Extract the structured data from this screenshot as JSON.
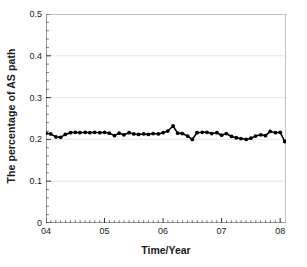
{
  "chart_data": {
    "type": "line",
    "title": "",
    "subtitle": "",
    "xlabel": "Time/Year",
    "ylabel": "The percentage of AS path",
    "xlim": [
      2004.0,
      2008.1
    ],
    "ylim": [
      0,
      0.5
    ],
    "grid": true,
    "grid_axis": "y",
    "legend": false,
    "legend_position": "none",
    "marker": "filled-circle",
    "line_color": "#000000",
    "marker_color": "#000000",
    "xtick_labels": [
      "04",
      "05",
      "06",
      "07",
      "08"
    ],
    "xtick_values": [
      2004,
      2005,
      2006,
      2007,
      2008
    ],
    "ytick_labels": [
      "0",
      "0.1",
      "0.2",
      "0.3",
      "0.4",
      "0.5"
    ],
    "ytick_values": [
      0,
      0.1,
      0.2,
      0.3,
      0.4,
      0.5
    ],
    "x_minor_ticks_per_interval": 12,
    "y_minor_ticks_per_interval": 5,
    "series": [
      {
        "name": "The percentage of AS path",
        "x": [
          2004.0,
          2004.08,
          2004.17,
          2004.25,
          2004.33,
          2004.42,
          2004.5,
          2004.58,
          2004.67,
          2004.75,
          2004.83,
          2004.92,
          2005.0,
          2005.08,
          2005.17,
          2005.25,
          2005.33,
          2005.42,
          2005.5,
          2005.58,
          2005.67,
          2005.75,
          2005.83,
          2005.92,
          2006.0,
          2006.08,
          2006.17,
          2006.25,
          2006.33,
          2006.42,
          2006.5,
          2006.58,
          2006.67,
          2006.75,
          2006.83,
          2006.92,
          2007.0,
          2007.08,
          2007.17,
          2007.25,
          2007.33,
          2007.42,
          2007.5,
          2007.58,
          2007.67,
          2007.75,
          2007.83,
          2007.92,
          2008.0,
          2008.08
        ],
        "values": [
          0.215,
          0.213,
          0.206,
          0.205,
          0.212,
          0.216,
          0.217,
          0.216,
          0.217,
          0.216,
          0.217,
          0.216,
          0.217,
          0.215,
          0.209,
          0.215,
          0.211,
          0.216,
          0.213,
          0.212,
          0.213,
          0.212,
          0.214,
          0.213,
          0.216,
          0.22,
          0.232,
          0.215,
          0.214,
          0.208,
          0.2,
          0.216,
          0.217,
          0.217,
          0.214,
          0.216,
          0.21,
          0.214,
          0.207,
          0.204,
          0.202,
          0.2,
          0.203,
          0.208,
          0.211,
          0.209,
          0.219,
          0.216,
          0.217,
          0.195
        ]
      }
    ],
    "annotations": []
  }
}
